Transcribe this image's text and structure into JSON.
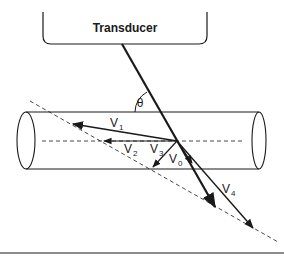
{
  "diagram": {
    "transducer_label": "Transducer",
    "angle_label": "θ",
    "vectors": [
      {
        "name": "V",
        "sub": "1"
      },
      {
        "name": "V",
        "sub": "2"
      },
      {
        "name": "V",
        "sub": "3"
      },
      {
        "name": "V",
        "sub": "0"
      },
      {
        "name": "V",
        "sub": "4"
      }
    ],
    "colors": {
      "stroke": "#1a1a1a",
      "background": "#ffffff"
    }
  }
}
